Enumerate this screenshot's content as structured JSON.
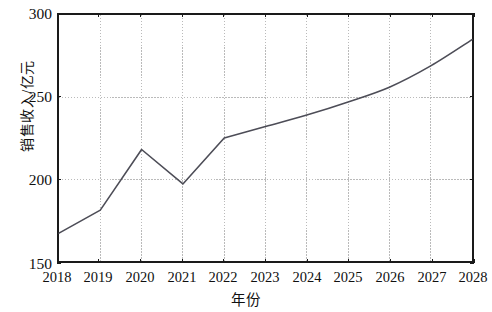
{
  "chart_data": {
    "type": "line",
    "title": "",
    "xlabel": "年份",
    "ylabel": "销售收入/亿元",
    "categories": [
      "2018",
      "2019",
      "2020",
      "2021",
      "2022",
      "2023",
      "2024",
      "2025",
      "2026",
      "2027",
      "2028"
    ],
    "x": [
      2018,
      2019,
      2020,
      2021,
      2022,
      2023,
      2024,
      2025,
      2026,
      2027,
      2028
    ],
    "values": [
      167,
      181,
      218,
      197,
      225,
      232,
      239,
      247,
      256,
      269,
      285
    ],
    "series": [
      {
        "name": "销售收入",
        "values": [
          167,
          181,
          218,
          197,
          225,
          232,
          239,
          247,
          256,
          269,
          285
        ]
      }
    ],
    "xlim": [
      2018,
      2028
    ],
    "ylim": [
      150,
      300
    ],
    "ytick_labels": [
      "150",
      "200",
      "250",
      "300"
    ],
    "ytick_values": [
      150,
      200,
      250,
      300
    ],
    "xtick_labels": [
      "2018",
      "2019",
      "2020",
      "2021",
      "2022",
      "2023",
      "2024",
      "2025",
      "2026",
      "2027",
      "2028"
    ],
    "grid": {
      "horizontal": true,
      "vertical": true,
      "style": "dotted",
      "color": "#b9b9b9"
    },
    "legend": null,
    "line_color": "#4d4d57",
    "line_width": 1.6,
    "markers": false,
    "smooth_from_index": 4,
    "axis_color": "#1a1a1a",
    "background_color": "#ffffff"
  }
}
